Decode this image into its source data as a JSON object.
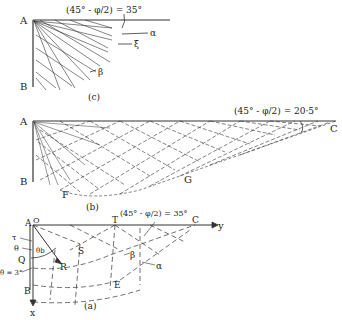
{
  "figure_c": {
    "caption": "(c)",
    "point_A": "A",
    "point_B": "B",
    "angle_label": "(45° - φ/2) = 35°",
    "alpha_label": "α",
    "xi_label": "ξ̄",
    "beta_label": "β"
  },
  "figure_b": {
    "caption": "(b)",
    "point_A": "A",
    "point_B": "B",
    "point_C": "C",
    "point_F": "F",
    "point_G": "G",
    "angle_label": "(45° - φ/2) = 20·5°"
  },
  "figure_a": {
    "caption": "(a)",
    "point_A": "A",
    "point_O": "O",
    "point_T": "T",
    "point_C": "C",
    "point_Q": "Q",
    "point_R": "R",
    "point_S": "S",
    "point_E": "E",
    "point_B": "B",
    "axis_y": "y",
    "axis_x": "x",
    "tau_label": "τ",
    "theta_label": "θ",
    "theta_b_label": "θb",
    "theta_3_label": "θ = 3°",
    "alpha_label": "α",
    "beta_label": "β",
    "angle_label": "(45° - φ/2) = 35°"
  }
}
